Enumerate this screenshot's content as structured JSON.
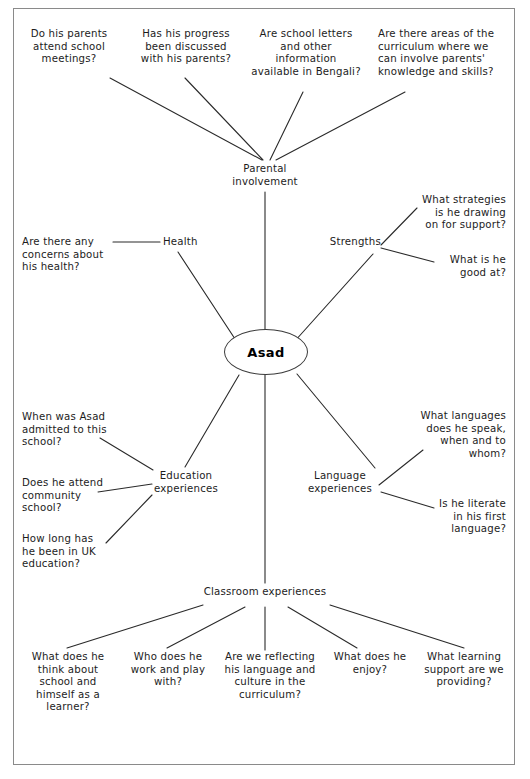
{
  "figure": {
    "caption": "",
    "frame": {
      "border_color": "#8a8a8a"
    }
  },
  "diagram": {
    "type": "mind-map",
    "center": {
      "label": "Asad",
      "shape": "ellipse"
    },
    "branches": [
      {
        "id": "parental-involvement",
        "label": "Parental\ninvolvement",
        "questions": [
          "Do his parents\nattend school\nmeetings?",
          "Has his progress\nbeen discussed\nwith his parents?",
          "Are school letters\nand other\ninformation\navailable in Bengali?",
          "Are there areas of the\ncurriculum where we\ncan involve parents'\nknowledge and skills?"
        ]
      },
      {
        "id": "health",
        "label": "Health",
        "questions": [
          "Are there any\nconcerns about\nhis health?"
        ]
      },
      {
        "id": "strengths",
        "label": "Strengths",
        "questions": [
          "What strategies\nis he drawing\non for support?",
          "What is he\ngood at?"
        ]
      },
      {
        "id": "education-experiences",
        "label": "Education\nexperiences",
        "questions": [
          "When was Asad\nadmitted to this\nschool?",
          "Does he attend\ncommunity\nschool?",
          "How long has\nhe been in UK\neducation?"
        ]
      },
      {
        "id": "language-experiences",
        "label": "Language\nexperiences",
        "questions": [
          "What languages\ndoes he speak,\nwhen and to\nwhom?",
          "Is he literate\nin his first\nlanguage?"
        ]
      },
      {
        "id": "classroom-experiences",
        "label": "Classroom experiences",
        "questions": [
          "What does he\nthink about\nschool and\nhimself as a\nlearner?",
          "Who does he\nwork and play\nwith?",
          "Are we reflecting\nhis language and\nculture in the\ncurriculum?",
          "What does he\nenjoy?",
          "What learning\nsupport are we\nproviding?"
        ]
      }
    ]
  }
}
